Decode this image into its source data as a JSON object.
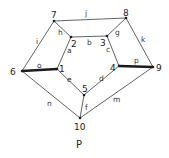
{
  "caption": "P",
  "colors": {
    "edge": "#3a3a3a",
    "thick_edge": "#1a1a1a",
    "background": "#ffffff"
  },
  "vertices": [
    {
      "id": "1",
      "label": "1",
      "x": 57,
      "y": 69
    },
    {
      "id": "2",
      "label": "2",
      "x": 71,
      "y": 37
    },
    {
      "id": "3",
      "label": "3",
      "x": 107,
      "y": 36
    },
    {
      "id": "4",
      "label": "4",
      "x": 119,
      "y": 66
    },
    {
      "id": "5",
      "label": "5",
      "x": 84,
      "y": 95
    },
    {
      "id": "6",
      "label": "6",
      "x": 22,
      "y": 71
    },
    {
      "id": "7",
      "label": "7",
      "x": 54,
      "y": 21
    },
    {
      "id": "8",
      "label": "8",
      "x": 126,
      "y": 18
    },
    {
      "id": "9",
      "label": "9",
      "x": 153,
      "y": 67
    },
    {
      "id": "10",
      "label": "10",
      "x": 80,
      "y": 118
    }
  ],
  "edges": [
    {
      "label": "a",
      "from": "2",
      "to": "1",
      "thick": false
    },
    {
      "label": "b",
      "from": "2",
      "to": "3",
      "thick": false
    },
    {
      "label": "c",
      "from": "3",
      "to": "4",
      "thick": false
    },
    {
      "label": "d",
      "from": "4",
      "to": "5",
      "thick": false
    },
    {
      "label": "e",
      "from": "1",
      "to": "5",
      "thick": false
    },
    {
      "label": "f",
      "from": "5",
      "to": "10",
      "thick": false
    },
    {
      "label": "g",
      "from": "8",
      "to": "3",
      "thick": false
    },
    {
      "label": "h",
      "from": "7",
      "to": "2",
      "thick": false
    },
    {
      "label": "i",
      "from": "7",
      "to": "6",
      "thick": false
    },
    {
      "label": "j",
      "from": "7",
      "to": "8",
      "thick": false
    },
    {
      "label": "k",
      "from": "8",
      "to": "9",
      "thick": false
    },
    {
      "label": "m",
      "from": "9",
      "to": "10",
      "thick": false
    },
    {
      "label": "n",
      "from": "6",
      "to": "10",
      "thick": false
    },
    {
      "label": "o",
      "from": "6",
      "to": "1",
      "thick": true
    },
    {
      "label": "p",
      "from": "4",
      "to": "9",
      "thick": true
    }
  ]
}
